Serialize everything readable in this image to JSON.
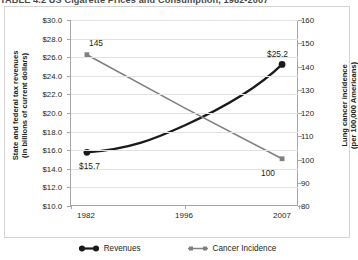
{
  "title": "TABLE 4.2  US Cigarette Prices and Consumption, 1982-2007",
  "axes": {
    "left_title": "State and federal tax revenues\n(in billions of current dollars)",
    "right_title": "Lung cancer incidence\n(per 100,000 Americans)",
    "left_ticks": [
      "$30.0",
      "$28.0",
      "$26.0",
      "$24.0",
      "$22.0",
      "$20.0",
      "$18.0",
      "$16.0",
      "$14.0",
      "$12.0",
      "$10.0"
    ],
    "right_ticks": [
      "160",
      "150",
      "140",
      "130",
      "120",
      "110",
      "100",
      "90",
      "80"
    ],
    "x_ticks": [
      "1982",
      "1996",
      "2007"
    ]
  },
  "legend": [
    {
      "label": "Revenues",
      "color": "#1a1a1a",
      "marker": "circle"
    },
    {
      "label": "Cancer Incidence",
      "color": "#808080",
      "marker": "square"
    }
  ],
  "point_labels": {
    "revenues_start": "$15.7",
    "revenues_end": "$25.2",
    "incidence_start": "145",
    "incidence_end": "100"
  },
  "chart_data": {
    "type": "line",
    "title": "TABLE 4.2  US Cigarette Prices and Consumption, 1982-2007",
    "xlabel": "",
    "categories": [
      "1982",
      "1996",
      "2007"
    ],
    "grid": true,
    "legend_position": "bottom",
    "series": [
      {
        "name": "Revenues",
        "axis": "left",
        "color": "#1a1a1a",
        "marker": "circle",
        "curved": true,
        "ylabel": "State and federal tax revenues (in billions of current dollars)",
        "ylim": [
          10.0,
          30.0
        ],
        "ytick_step": 2.0,
        "values": [
          15.7,
          18.6,
          25.2
        ],
        "labeled": {
          "1982": "$15.7",
          "2007": "$25.2"
        }
      },
      {
        "name": "Cancer Incidence",
        "axis": "right",
        "color": "#808080",
        "marker": "square",
        "curved": false,
        "ylabel": "Lung cancer incidence (per 100,000 Americans)",
        "ylim": [
          80,
          160
        ],
        "ytick_step": 10,
        "values": [
          145,
          122,
          100
        ],
        "labeled": {
          "1982": "145",
          "2007": "100"
        }
      }
    ]
  }
}
